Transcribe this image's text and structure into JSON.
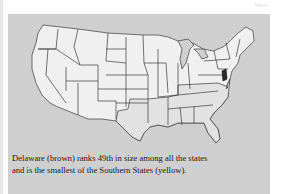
{
  "header": {
    "label": "Name"
  },
  "map": {
    "title": "United States map",
    "highlighted_state": "Delaware",
    "colors": {
      "background": "#cfcfcf",
      "state_fill": "#f0f0f0",
      "southern_fill": "#e2e2e2",
      "border": "#3a3a3a",
      "delaware": "#2a2a2a"
    }
  },
  "caption": {
    "line1": "Delaware (brown) ranks 49th in size among all the states",
    "line2": "and is the smallest of the Southern States (yellow)."
  }
}
